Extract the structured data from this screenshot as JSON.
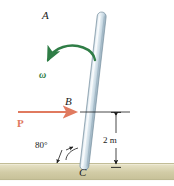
{
  "figure": {
    "background_color": "#ffffff"
  },
  "labels": {
    "point_a": "A",
    "point_b": "B",
    "point_c": "C",
    "angular_velocity": "ω",
    "force": "P",
    "angle": "80°",
    "dimension": "2 m"
  },
  "colors": {
    "rod_light": "#f2f7fa",
    "rod_mid": "#cfdde6",
    "rod_dark": "#9fb4c2",
    "rod_outline": "#7d94a3",
    "omega_green": "#2f7d46",
    "force_salmon": "#e07a5f",
    "ground_top": "#fbfaf2",
    "ground_body": "#cfc9a4",
    "ground_edge": "#b9b389",
    "line_black": "#1a1a1a",
    "text_black": "#1a1a1a"
  },
  "geometry": {
    "rod_top_x": 66,
    "rod_top_y": 12,
    "rod_bottom_x": 84,
    "rod_bottom_y": 169,
    "rod_width": 9,
    "ground_top_y": 163,
    "ground_bottom_y": 180,
    "point_b_x": 78,
    "point_b_y": 112,
    "force_arrow_start_x": 18,
    "force_arrow_end_x": 79,
    "force_arrow_y": 112,
    "dim_line_x": 116,
    "dim_line_top_y": 112,
    "dim_line_bottom_y": 168,
    "leader_line_start_x": 80,
    "leader_line_end_x": 130,
    "angle_degrees": 80
  }
}
